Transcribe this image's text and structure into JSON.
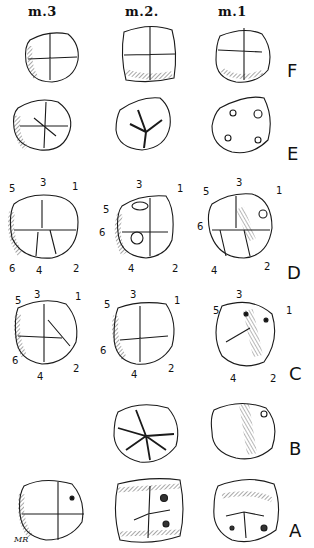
{
  "figure": {
    "column_headers": [
      "m.3",
      "m.2.",
      "m.1"
    ],
    "row_labels": [
      "F",
      "E",
      "D",
      "C",
      "B",
      "A"
    ],
    "signature": "MR",
    "cusp_labels": {
      "D": {
        "m3": [
          "5",
          "3",
          "1",
          "6",
          "4",
          "2"
        ],
        "m2": [
          "3",
          "1",
          "5",
          "6",
          "4",
          "2"
        ],
        "m1": [
          "3",
          "5",
          "1",
          "6",
          "4",
          "2"
        ]
      },
      "C": {
        "m3": [
          "5",
          "3",
          "1",
          "6",
          "4",
          "2"
        ],
        "m2": [
          "3",
          "1",
          "5",
          "6",
          "4",
          "2"
        ],
        "m1": [
          "3",
          "5",
          "1",
          "4",
          "2"
        ]
      }
    },
    "stroke_color": "#1a1a1a",
    "background": "#ffffff"
  }
}
